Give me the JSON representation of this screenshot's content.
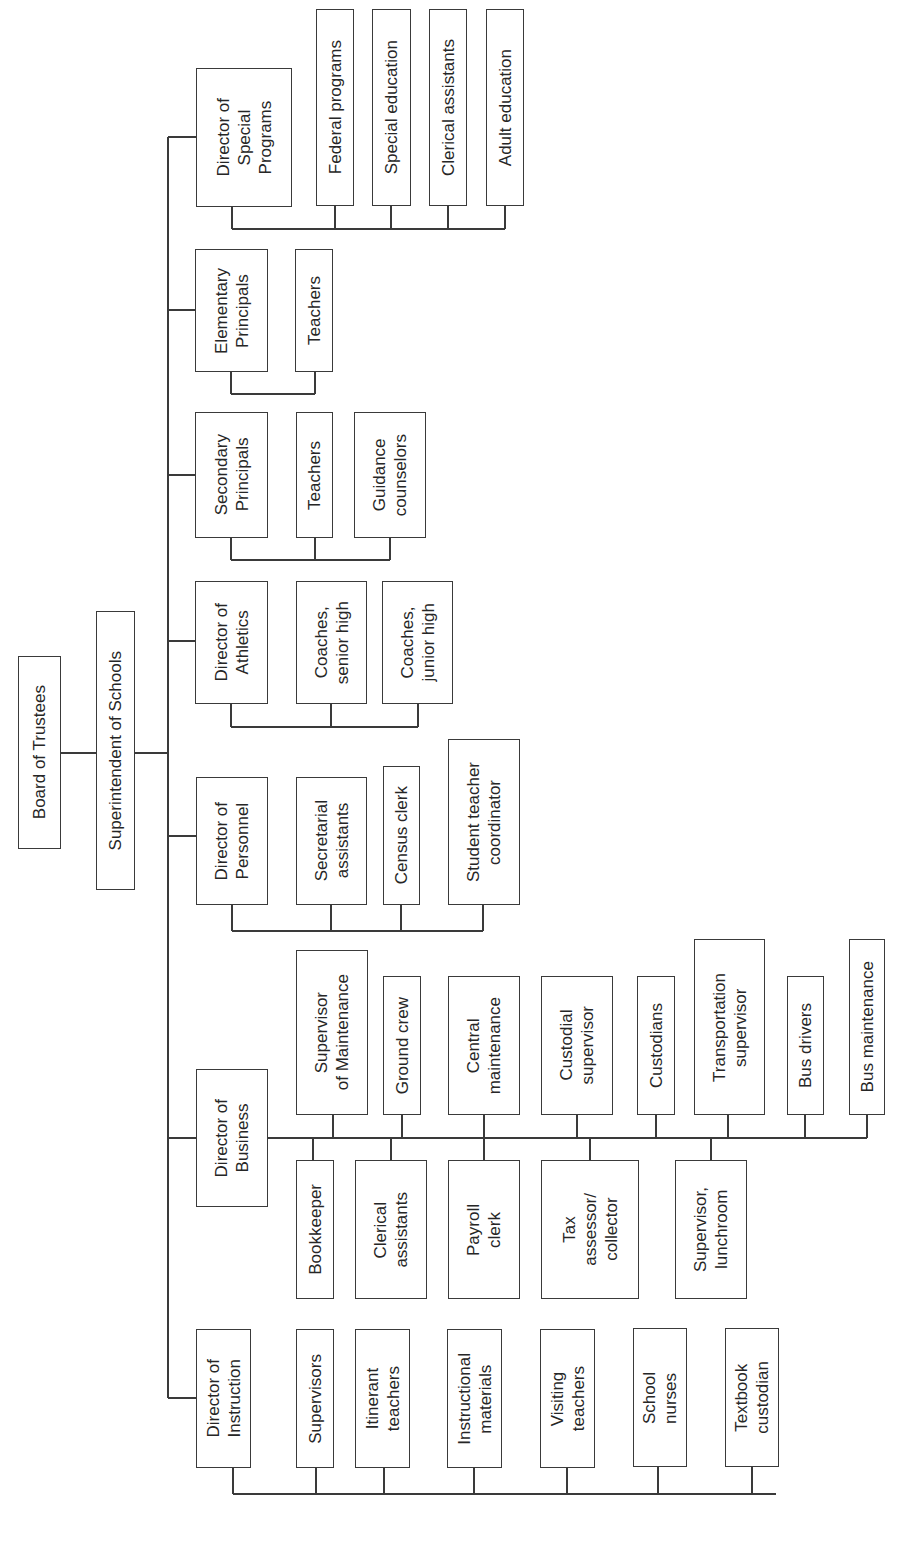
{
  "chart": {
    "type": "org-chart",
    "orientation": "rotated-90-ccw",
    "line_color": "#3a3a3a",
    "box_border_color": "#3a3a3a",
    "text_color": "#262626"
  },
  "nodes": [
    {
      "id": "board",
      "label": "Board of Trustees",
      "x": 18,
      "y": 656,
      "w": 43,
      "h": 193
    },
    {
      "id": "superintendent",
      "label": "Superintendent of Schools",
      "x": 96,
      "y": 611,
      "w": 39,
      "h": 279
    },
    {
      "id": "dir-special-programs",
      "label": "Director of\nSpecial\nPrograms",
      "x": 196,
      "y": 68,
      "w": 96,
      "h": 139
    },
    {
      "id": "federal-programs",
      "label": "Federal programs",
      "x": 316,
      "y": 9,
      "w": 38,
      "h": 197
    },
    {
      "id": "special-education",
      "label": "Special education",
      "x": 372,
      "y": 9,
      "w": 39,
      "h": 197
    },
    {
      "id": "clerical-assistants-sp",
      "label": "Clerical assistants",
      "x": 429,
      "y": 9,
      "w": 38,
      "h": 197
    },
    {
      "id": "adult-education",
      "label": "Adult education",
      "x": 486,
      "y": 9,
      "w": 38,
      "h": 197
    },
    {
      "id": "elementary-principals",
      "label": "Elementary\nPrincipals",
      "x": 195,
      "y": 249,
      "w": 73,
      "h": 123
    },
    {
      "id": "teachers-elem",
      "label": "Teachers",
      "x": 295,
      "y": 249,
      "w": 38,
      "h": 123
    },
    {
      "id": "secondary-principals",
      "label": "Secondary\nPrincipals",
      "x": 195,
      "y": 412,
      "w": 73,
      "h": 126
    },
    {
      "id": "teachers-sec",
      "label": "Teachers",
      "x": 296,
      "y": 412,
      "w": 37,
      "h": 126
    },
    {
      "id": "guidance-counselors",
      "label": "Guidance\ncounselors",
      "x": 354,
      "y": 412,
      "w": 72,
      "h": 126
    },
    {
      "id": "dir-athletics",
      "label": "Director of\nAthletics",
      "x": 195,
      "y": 581,
      "w": 73,
      "h": 123
    },
    {
      "id": "coaches-senior",
      "label": "Coaches,\nsenior high",
      "x": 296,
      "y": 581,
      "w": 71,
      "h": 123
    },
    {
      "id": "coaches-junior",
      "label": "Coaches,\njunior high",
      "x": 382,
      "y": 581,
      "w": 71,
      "h": 123
    },
    {
      "id": "dir-personnel",
      "label": "Director of\nPersonnel",
      "x": 196,
      "y": 777,
      "w": 72,
      "h": 128
    },
    {
      "id": "secretarial-assistants",
      "label": "Secretarial\nassistants",
      "x": 296,
      "y": 777,
      "w": 71,
      "h": 128
    },
    {
      "id": "census-clerk",
      "label": "Census clerk",
      "x": 383,
      "y": 766,
      "w": 37,
      "h": 139
    },
    {
      "id": "student-teacher-coordinator",
      "label": "Student teacher\ncoordinator",
      "x": 448,
      "y": 739,
      "w": 72,
      "h": 166
    },
    {
      "id": "dir-business",
      "label": "Director of\nBusiness",
      "x": 196,
      "y": 1069,
      "w": 72,
      "h": 138
    },
    {
      "id": "supervisor-maintenance",
      "label": "Supervisor\nof Maintenance",
      "x": 296,
      "y": 950,
      "w": 72,
      "h": 165
    },
    {
      "id": "ground-crew",
      "label": "Ground crew",
      "x": 383,
      "y": 976,
      "w": 38,
      "h": 139
    },
    {
      "id": "central-maintenance",
      "label": "Central\nmaintenance",
      "x": 448,
      "y": 976,
      "w": 72,
      "h": 139
    },
    {
      "id": "custodial-supervisor",
      "label": "Custodial\nsupervisor",
      "x": 541,
      "y": 976,
      "w": 72,
      "h": 139
    },
    {
      "id": "custodians",
      "label": "Custodians",
      "x": 637,
      "y": 976,
      "w": 38,
      "h": 139
    },
    {
      "id": "transportation-supervisor",
      "label": "Transportation\nsupervisor",
      "x": 694,
      "y": 939,
      "w": 71,
      "h": 176
    },
    {
      "id": "bus-drivers",
      "label": "Bus drivers",
      "x": 787,
      "y": 976,
      "w": 37,
      "h": 139
    },
    {
      "id": "bus-maintenance",
      "label": "Bus maintenance",
      "x": 849,
      "y": 939,
      "w": 36,
      "h": 176
    },
    {
      "id": "bookkeeper",
      "label": "Bookkeeper",
      "x": 296,
      "y": 1160,
      "w": 38,
      "h": 139
    },
    {
      "id": "clerical-assistants-bus",
      "label": "Clerical\nassistants",
      "x": 355,
      "y": 1160,
      "w": 72,
      "h": 139
    },
    {
      "id": "payroll-clerk",
      "label": "Payroll\nclerk",
      "x": 448,
      "y": 1160,
      "w": 72,
      "h": 139
    },
    {
      "id": "tax-assessor",
      "label": "Tax\nassessor/\ncollector",
      "x": 541,
      "y": 1160,
      "w": 98,
      "h": 139
    },
    {
      "id": "supervisor-lunchroom",
      "label": "Supervisor,\nlunchroom",
      "x": 675,
      "y": 1160,
      "w": 72,
      "h": 139
    },
    {
      "id": "dir-instruction",
      "label": "Director of\nInstruction",
      "x": 196,
      "y": 1329,
      "w": 55,
      "h": 139
    },
    {
      "id": "supervisors",
      "label": "Supervisors",
      "x": 296,
      "y": 1329,
      "w": 38,
      "h": 139
    },
    {
      "id": "itinerant-teachers",
      "label": "Itinerant\nteachers",
      "x": 355,
      "y": 1329,
      "w": 55,
      "h": 139
    },
    {
      "id": "instructional-materials",
      "label": "Instructional\nmaterials",
      "x": 447,
      "y": 1329,
      "w": 55,
      "h": 139
    },
    {
      "id": "visiting-teachers",
      "label": "Visiting\nteachers",
      "x": 540,
      "y": 1329,
      "w": 55,
      "h": 139
    },
    {
      "id": "school-nurses",
      "label": "School\nnurses",
      "x": 633,
      "y": 1328,
      "w": 54,
      "h": 139
    },
    {
      "id": "textbook-custodian",
      "label": "Textbook\ncustodian",
      "x": 725,
      "y": 1328,
      "w": 54,
      "h": 139
    }
  ],
  "lines": [
    [
      61,
      753,
      96,
      753
    ],
    [
      135,
      753,
      168,
      753
    ],
    [
      168,
      137,
      168,
      1398
    ],
    [
      168,
      137,
      196,
      137
    ],
    [
      232,
      207,
      232,
      229
    ],
    [
      232,
      229,
      505,
      229
    ],
    [
      335,
      206,
      335,
      229
    ],
    [
      391,
      206,
      391,
      229
    ],
    [
      448,
      206,
      448,
      229
    ],
    [
      505,
      206,
      505,
      229
    ],
    [
      168,
      310,
      195,
      310
    ],
    [
      231,
      372,
      231,
      394
    ],
    [
      231,
      394,
      315,
      394
    ],
    [
      315,
      372,
      315,
      394
    ],
    [
      168,
      475,
      195,
      475
    ],
    [
      231,
      538,
      231,
      560
    ],
    [
      231,
      560,
      390,
      560
    ],
    [
      315,
      538,
      315,
      560
    ],
    [
      390,
      538,
      390,
      560
    ],
    [
      168,
      641,
      195,
      641
    ],
    [
      231,
      704,
      231,
      727
    ],
    [
      231,
      727,
      418,
      727
    ],
    [
      331,
      704,
      331,
      727
    ],
    [
      418,
      704,
      418,
      727
    ],
    [
      168,
      836,
      196,
      836
    ],
    [
      232,
      905,
      232,
      931
    ],
    [
      232,
      931,
      483,
      931
    ],
    [
      331,
      905,
      331,
      931
    ],
    [
      401,
      905,
      401,
      931
    ],
    [
      483,
      905,
      483,
      931
    ],
    [
      168,
      1138,
      196,
      1138
    ],
    [
      268,
      1138,
      867,
      1138
    ],
    [
      333,
      1115,
      333,
      1138
    ],
    [
      402,
      1115,
      402,
      1138
    ],
    [
      484,
      1115,
      484,
      1160
    ],
    [
      577,
      1115,
      577,
      1138
    ],
    [
      656,
      1115,
      656,
      1138
    ],
    [
      728,
      1115,
      728,
      1138
    ],
    [
      805,
      1115,
      805,
      1138
    ],
    [
      867,
      1115,
      867,
      1138
    ],
    [
      313,
      1138,
      313,
      1160
    ],
    [
      391,
      1138,
      391,
      1160
    ],
    [
      590,
      1138,
      590,
      1160
    ],
    [
      711,
      1138,
      711,
      1160
    ],
    [
      168,
      1398,
      196,
      1398
    ],
    [
      233,
      1468,
      233,
      1494
    ],
    [
      233,
      1494,
      776,
      1494
    ],
    [
      316,
      1468,
      316,
      1494
    ],
    [
      384,
      1468,
      384,
      1494
    ],
    [
      474,
      1468,
      474,
      1494
    ],
    [
      567,
      1468,
      567,
      1494
    ],
    [
      658,
      1467,
      658,
      1494
    ],
    [
      752,
      1467,
      752,
      1494
    ]
  ]
}
